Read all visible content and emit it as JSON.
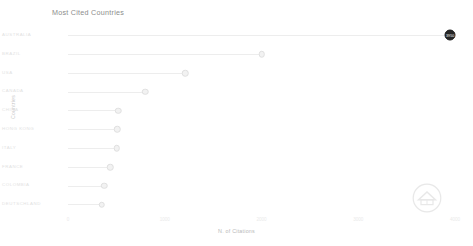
{
  "chart_data": {
    "type": "bar",
    "subtype": "lollipop-horizontal",
    "title": "Most Cited Countries",
    "xlabel": "N. of Citations",
    "ylabel": "Countries",
    "categories": [
      "AUSTRALIA",
      "BRAZIL",
      "USA",
      "CANADA",
      "CHINA",
      "HONG KONG",
      "ITALY",
      "FRANCE",
      "COLOMBIA",
      "DEUTSCHLAND"
    ],
    "values": [
      3950,
      2000,
      1210,
      800,
      520,
      510,
      505,
      435,
      375,
      350
    ],
    "point_labels": [
      "3950",
      "",
      "",
      "",
      "",
      "",
      "",
      "",
      "",
      ""
    ],
    "highlight_index": 0,
    "xlim": [
      0,
      4000
    ],
    "xticks": [
      0,
      1000,
      2000,
      3000,
      4000
    ],
    "xtick_labels": [
      "0",
      "1000",
      "2000",
      "3000",
      "4000"
    ],
    "grid": false,
    "legend": "none"
  },
  "watermark": {
    "name": "circular-logo-watermark"
  }
}
